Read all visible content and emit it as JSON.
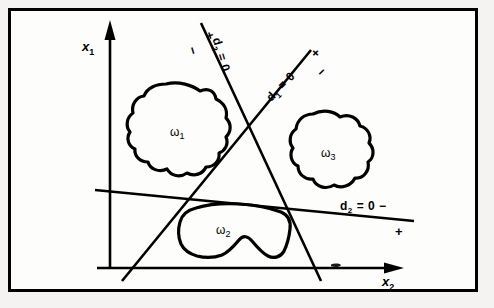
{
  "figure": {
    "type": "diagram",
    "title": "",
    "background_color": "#f4f3f1",
    "panel_color": "#fdfdfc",
    "ink_color": "#000000",
    "frame": {
      "visible": true,
      "border_px": 3
    },
    "axes": {
      "x1": {
        "label": "x",
        "subscript": "1",
        "direction": "up",
        "arrow": true
      },
      "x2": {
        "label": "x",
        "subscript": "2",
        "direction": "right",
        "arrow": true
      }
    },
    "regions": [
      {
        "name": "omega-1",
        "label": "ω",
        "subscript": "1",
        "position": "upper-left"
      },
      {
        "name": "omega-2",
        "label": "ω",
        "subscript": "2",
        "position": "lower-center"
      },
      {
        "name": "omega-3",
        "label": "ω",
        "subscript": "3",
        "position": "right"
      }
    ],
    "decision_lines": [
      {
        "name": "d1",
        "label": "d",
        "subscript": "1",
        "equation": "= 0",
        "full_text": "d₁ = 0",
        "positive_side": "+",
        "negative_side": "−",
        "orientation": "up-right-diagonal"
      },
      {
        "name": "d2",
        "label": "d",
        "subscript": "2",
        "equation": "= 0",
        "full_text": "d₂ = 0",
        "positive_side": "+",
        "negative_side": "−",
        "orientation": "near-horizontal"
      },
      {
        "name": "d3",
        "label": "d",
        "subscript": "3",
        "equation": "= 0",
        "full_text": "d₃ = 0",
        "positive_side": "+",
        "negative_side": "−",
        "orientation": "down-right-steep"
      }
    ]
  }
}
